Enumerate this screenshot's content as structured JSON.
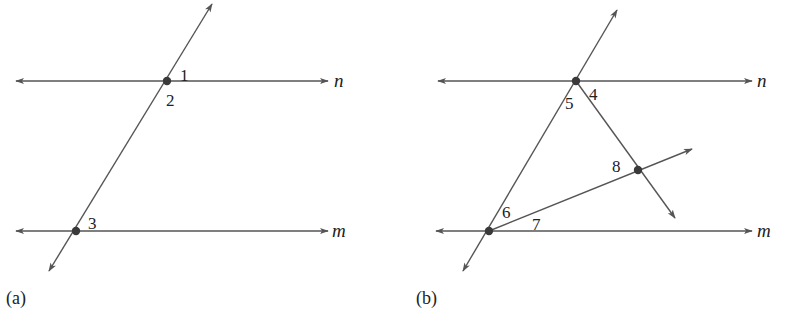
{
  "figures": [
    {
      "caption": "(a)",
      "lines": [
        {
          "name": "n",
          "label": "n"
        },
        {
          "name": "m",
          "label": "m"
        },
        {
          "name": "transversal",
          "label": ""
        }
      ],
      "points": [
        {
          "name": "intersection-n",
          "x": 167,
          "y": 81
        },
        {
          "name": "intersection-m",
          "x": 76,
          "y": 231
        }
      ],
      "angles": [
        "1",
        "2",
        "3"
      ]
    },
    {
      "caption": "(b)",
      "lines": [
        {
          "name": "n",
          "label": "n"
        },
        {
          "name": "m",
          "label": "m"
        },
        {
          "name": "transversal-1",
          "label": ""
        },
        {
          "name": "transversal-2",
          "label": ""
        },
        {
          "name": "transversal-3",
          "label": ""
        }
      ],
      "points": [
        {
          "name": "intersection-n",
          "x": 576,
          "y": 81
        },
        {
          "name": "intersection-m",
          "x": 489,
          "y": 231
        },
        {
          "name": "intersection-interior",
          "x": 638,
          "y": 170
        }
      ],
      "angles": [
        "4",
        "5",
        "6",
        "7",
        "8"
      ]
    }
  ],
  "colors": {
    "line": "#555555",
    "point": "#3a3a3a",
    "text": "#222222",
    "background": "#ffffff"
  }
}
